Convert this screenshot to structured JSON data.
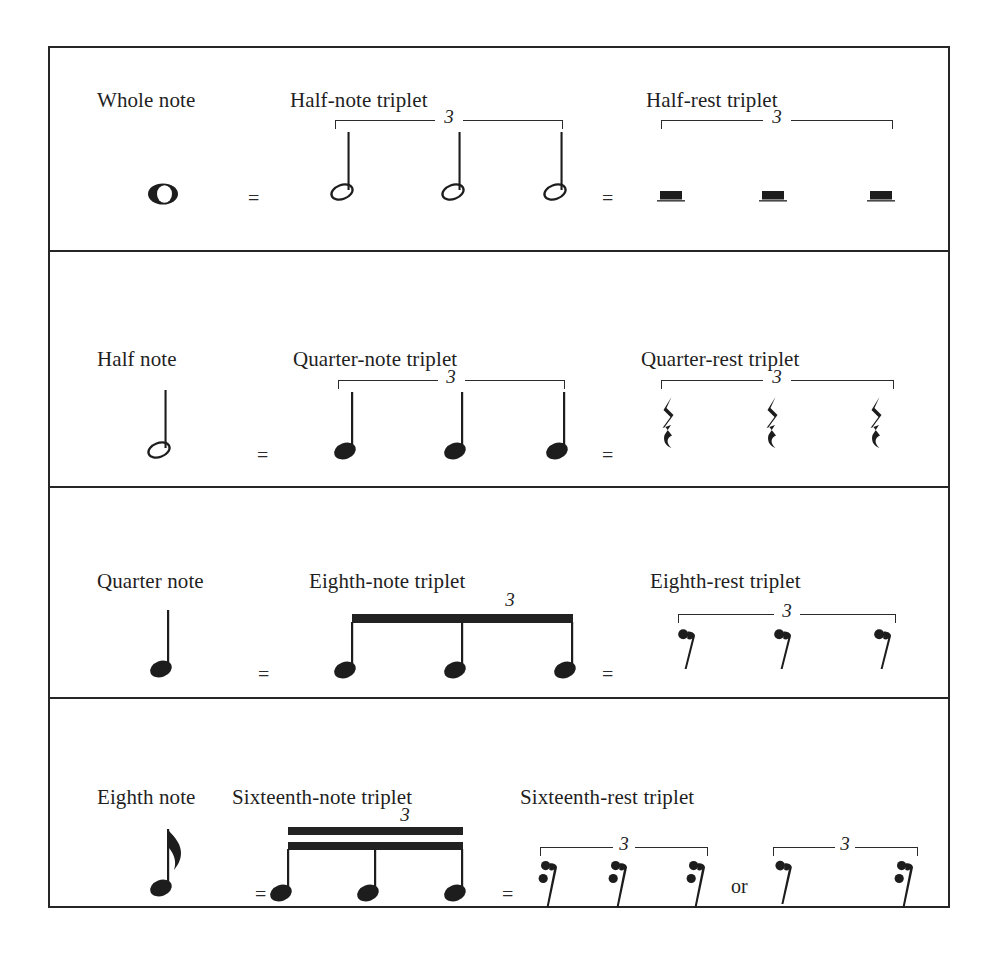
{
  "diagram": {
    "colors": {
      "ink": "#222222",
      "frame": "#262626",
      "background": "#ffffff"
    },
    "equals_sign": "=",
    "or_word": "or",
    "triplet_number": "3",
    "rows": [
      {
        "id": "whole-note-row",
        "base_label": "Whole note",
        "base_glyph": "whole-note",
        "middle_label": "Half-note triplet",
        "middle_glyph": "half-note",
        "middle_grouping": "bracket",
        "right_label": "Half-rest triplet",
        "right_glyph": "half-rest",
        "right_grouping": "bracket",
        "count": 3,
        "alternate": false
      },
      {
        "id": "half-note-row",
        "base_label": "Half note",
        "base_glyph": "half-note",
        "middle_label": "Quarter-note triplet",
        "middle_glyph": "quarter-note",
        "middle_grouping": "bracket",
        "right_label": "Quarter-rest triplet",
        "right_glyph": "quarter-rest",
        "right_grouping": "bracket",
        "count": 3,
        "alternate": false
      },
      {
        "id": "quarter-note-row",
        "base_label": "Quarter note",
        "base_glyph": "quarter-note",
        "middle_label": "Eighth-note triplet",
        "middle_glyph": "eighth-note-beamed",
        "middle_grouping": "beam",
        "right_label": "Eighth-rest triplet",
        "right_glyph": "eighth-rest",
        "right_grouping": "bracket",
        "count": 3,
        "alternate": false
      },
      {
        "id": "eighth-note-row",
        "base_label": "Eighth note",
        "base_glyph": "eighth-note",
        "middle_label": "Sixteenth-note triplet",
        "middle_glyph": "sixteenth-note-beamed",
        "middle_grouping": "double-beam",
        "right_label": "Sixteenth-rest triplet",
        "right_glyph": "sixteenth-rest",
        "right_grouping": "bracket",
        "count": 3,
        "alternate": true,
        "alternate_glyphs": [
          "eighth-rest",
          "sixteenth-rest"
        ]
      }
    ]
  }
}
